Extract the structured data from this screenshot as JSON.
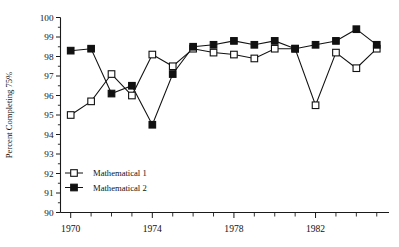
{
  "chart_data": {
    "type": "line",
    "title": "",
    "xlabel": "",
    "ylabel": "Percent Completing 75%",
    "x": [
      1970,
      1971,
      1972,
      1973,
      1974,
      1975,
      1976,
      1977,
      1978,
      1979,
      1980,
      1981,
      1982,
      1983,
      1984,
      1985
    ],
    "xlim": [
      1969.5,
      1985.6
    ],
    "ylim": [
      90,
      100
    ],
    "ytick_labels": [
      "90",
      "91",
      "92",
      "93",
      "94",
      "95",
      "96",
      "97",
      "98",
      "99",
      "100"
    ],
    "ytick_values": [
      90,
      91,
      92,
      93,
      94,
      95,
      96,
      97,
      98,
      99,
      100
    ],
    "xtick_labels": [
      "1970",
      "1974",
      "1978",
      "1982"
    ],
    "xtick_values": [
      1970,
      1974,
      1978,
      1982
    ],
    "x_minor_ticks": [
      1970,
      1971,
      1972,
      1973,
      1974,
      1975,
      1976,
      1977,
      1978,
      1979,
      1980,
      1981,
      1982,
      1983,
      1984,
      1985
    ],
    "grid": false,
    "legend_position": "lower-left-inside",
    "series": [
      {
        "name": "Mathematical 1",
        "marker": "open-square",
        "values": [
          95.0,
          95.7,
          97.1,
          96.0,
          98.1,
          97.5,
          98.4,
          98.2,
          98.1,
          97.9,
          98.4,
          98.4,
          95.5,
          98.2,
          97.4,
          98.4
        ]
      },
      {
        "name": "Mathematical 2",
        "marker": "filled-square",
        "values": [
          98.3,
          98.4,
          96.1,
          96.5,
          94.5,
          97.1,
          98.5,
          98.6,
          98.8,
          98.6,
          98.8,
          98.4,
          98.6,
          98.8,
          99.4,
          98.6
        ]
      }
    ]
  },
  "legend": {
    "items": [
      {
        "label": "Mathematical 1",
        "marker": "open-square"
      },
      {
        "label": "Mathematical 2",
        "marker": "filled-square"
      }
    ]
  },
  "colors": {
    "ink": "#111111",
    "background": "#ffffff",
    "marker_open_fill": "#ffffff",
    "marker_filled_fill": "#111111"
  }
}
